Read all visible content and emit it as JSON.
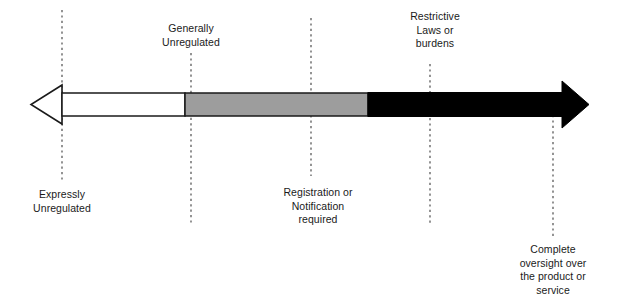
{
  "diagram": {
    "type": "double-headed-arrow-spectrum",
    "colors": {
      "background": "#ffffff",
      "segment_unregulated": "#ffffff",
      "segment_moderate": "#9d9d9d",
      "segment_restrictive": "#000000",
      "outline": "#1a1a1a",
      "dashed_guide": "#4d4d4d",
      "text": "#1a1a1a"
    },
    "arrow": {
      "left_tip_x": 31,
      "right_tip_x": 589,
      "bar_top_y": 93,
      "bar_bottom_y": 116,
      "left_arrowhead_base_x": 62,
      "right_arrowhead_base_x": 562,
      "segment_break_1_x": 185,
      "segment_break_2_x": 368
    },
    "segments": [
      {
        "name": "expressly-unregulated",
        "fill": "#ffffff",
        "from_x": 62,
        "to_x": 185
      },
      {
        "name": "generally-unregulated",
        "fill": "#9d9d9d",
        "from_x": 185,
        "to_x": 368
      },
      {
        "name": "restrictive",
        "fill": "#000000",
        "from_x": 368,
        "to_x": 562
      }
    ],
    "guides": [
      {
        "name": "guide-expressly-unregulated",
        "x": 62,
        "y1": 10,
        "y2": 181
      },
      {
        "name": "guide-generally-unregulated",
        "x": 191,
        "y1": 53,
        "y2": 224
      },
      {
        "name": "guide-registration-notification",
        "x": 311,
        "y1": 18,
        "y2": 176
      },
      {
        "name": "guide-restrictive-laws",
        "x": 430,
        "y1": 64,
        "y2": 226
      },
      {
        "name": "guide-complete-oversight",
        "x": 553,
        "y1": 115,
        "y2": 236
      }
    ],
    "labels": [
      {
        "name": "label-generally-unregulated",
        "text": "Generally\nUnregulated",
        "position": "above",
        "x": 191,
        "y": 22,
        "lines": [
          "Generally",
          "Unregulated"
        ]
      },
      {
        "name": "label-restrictive-laws",
        "text": "Restrictive\nLaws or\nburdens",
        "position": "above",
        "x": 435,
        "y": 10,
        "lines": [
          "Restrictive",
          "Laws or",
          "burdens"
        ]
      },
      {
        "name": "label-expressly-unregulated",
        "text": "Expressly\nUnregulated",
        "position": "below",
        "x": 62,
        "y": 188,
        "lines": [
          "Expressly",
          "Unregulated"
        ]
      },
      {
        "name": "label-registration-notification",
        "text": "Registration or\nNotification\nrequired",
        "position": "below",
        "x": 318,
        "y": 186,
        "lines": [
          "Registration or",
          "Notification",
          "required"
        ]
      },
      {
        "name": "label-complete-oversight",
        "text": "Complete\noversight over\nthe product or\nservice",
        "position": "below",
        "x": 553,
        "y": 243,
        "lines": [
          "Complete",
          "oversight over",
          "the product or",
          "service"
        ]
      }
    ]
  }
}
